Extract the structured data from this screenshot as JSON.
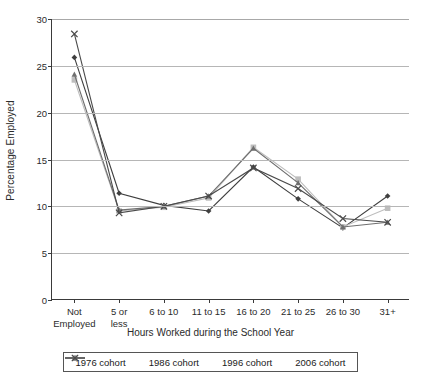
{
  "chart_data": {
    "type": "line",
    "title": "",
    "xlabel": "Hours Worked during the School Year",
    "ylabel": "Percentage Employed",
    "ylim": [
      0,
      30
    ],
    "yticks": [
      0,
      5,
      10,
      15,
      20,
      25,
      30
    ],
    "grid": true,
    "legend_position": "bottom",
    "categories": [
      "Not\nEmployed",
      "5 or\nless",
      "6 to 10",
      "11 to 15",
      "16 to 20",
      "21 to 25",
      "26 to 30",
      "31+"
    ],
    "series": [
      {
        "name": "1976 cohort",
        "marker": "diamond",
        "color": "#3f3f3f",
        "values": [
          25.9,
          11.4,
          10.1,
          9.5,
          14.2,
          10.8,
          7.7,
          11.1
        ]
      },
      {
        "name": "1986 cohort",
        "marker": "square",
        "color": "#bdbdbd",
        "values": [
          23.5,
          9.5,
          9.9,
          10.9,
          16.3,
          12.9,
          7.8,
          9.8
        ]
      },
      {
        "name": "1996 cohort",
        "marker": "triangle",
        "color": "#6e6e6e",
        "values": [
          24.1,
          9.6,
          10.0,
          11.1,
          16.2,
          12.5,
          7.8,
          8.3
        ]
      },
      {
        "name": "2006 cohort",
        "marker": "x",
        "color": "#4a4a4a",
        "values": [
          28.4,
          9.3,
          10.0,
          11.1,
          14.1,
          11.9,
          8.7,
          8.3
        ]
      }
    ]
  },
  "axis": {
    "y_ticks": [
      "0",
      "5",
      "10",
      "15",
      "20",
      "25",
      "30"
    ],
    "y_title": "Percentage Employed",
    "x_title": "Hours Worked during the School Year",
    "x_ticks": [
      "Not\nEmployed",
      "5 or\nless",
      "6 to 10",
      "11 to 15",
      "16 to 20",
      "21 to 25",
      "26 to 30",
      "31+"
    ]
  },
  "legend": {
    "items": [
      {
        "label": "1976 cohort"
      },
      {
        "label": "1986 cohort"
      },
      {
        "label": "1996 cohort"
      },
      {
        "label": "2006 cohort"
      }
    ]
  }
}
